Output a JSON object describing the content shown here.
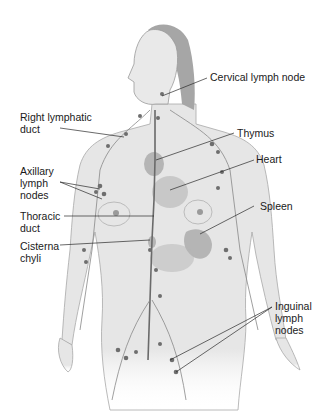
{
  "figure": {
    "labels": {
      "cervical": "Cervical lymph node",
      "right_lymphatic": "Right lymphatic\nduct",
      "thymus": "Thymus",
      "axillary": "Axillary\nlymph\nnodes",
      "heart": "Heart",
      "thoracic": "Thoracic\nduct",
      "spleen": "Spleen",
      "cisterna": "Cisterna\nchyli",
      "inguinal": "Inguinal\nlymph\nnodes"
    },
    "colors": {
      "skin": "#e4e4e4",
      "skin_outline": "#9a9a9a",
      "hair": "#9c9c9c",
      "node": "#6e6e6e",
      "organ": "#8a8a8a",
      "leader": "#2a2a2a"
    }
  }
}
